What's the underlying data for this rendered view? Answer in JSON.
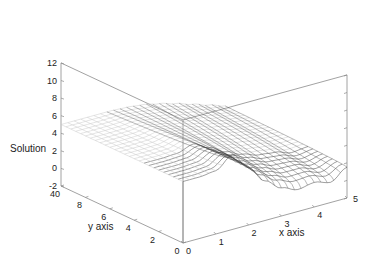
{
  "chart_data": {
    "type": "surface3d",
    "title": "",
    "xlabel": "x axis",
    "ylabel": "y axis",
    "zlabel": "Solution",
    "xlim": [
      0,
      5
    ],
    "ylim": [
      0,
      10
    ],
    "zlim": [
      -2,
      12
    ],
    "x_ticks": [
      "0",
      "1",
      "2",
      "3",
      "4",
      "5"
    ],
    "y_ticks": [
      "0",
      "2",
      "4",
      "6",
      "8",
      "10"
    ],
    "y_tick_labels_shown": [
      "0",
      "2",
      "4",
      "6",
      "8",
      "40"
    ],
    "z_ticks": [
      "-2",
      "0",
      "2",
      "4",
      "6",
      "8",
      "10",
      "12"
    ],
    "grid": false,
    "legend": "none",
    "surface_description": "Wireframe mesh; z≈5 plateau for low x; bump near x≈1.5 rising to ≈7 at y=0 edge; dip to ≈0 near x≈4 at low y; rises again to ≈1.5 at x=5",
    "mesh": {
      "nx": 25,
      "ny": 25
    },
    "surface_samples": {
      "x": [
        0,
        0.5,
        1,
        1.5,
        2,
        2.5,
        3,
        3.5,
        4,
        4.5,
        5
      ],
      "z_at_y0": [
        5,
        5,
        5.2,
        6.5,
        4.5,
        2.5,
        1.2,
        0.5,
        0.8,
        0.3,
        1.5
      ],
      "z_at_y10": [
        5,
        5,
        5,
        5,
        4.9,
        4.7,
        4.3,
        3.8,
        3.2,
        2.6,
        2
      ]
    }
  },
  "colors": {
    "axis": "#8a8a8a",
    "mesh_light": "#c8c8c8",
    "mesh_dark": "#404040"
  }
}
